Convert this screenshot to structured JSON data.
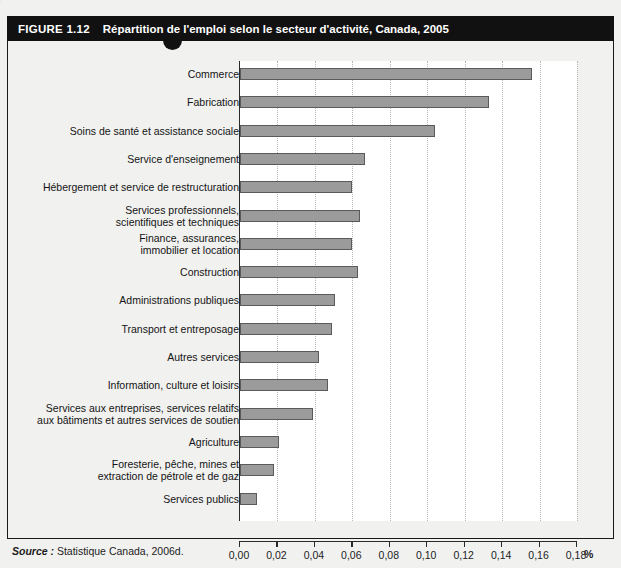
{
  "figure": {
    "number": "FIGURE 1.12",
    "title": "Répartition de l'emploi selon le secteur d'activité, Canada, 2005",
    "source_key": "Source :",
    "source_value": " Statistique Canada, 2006d."
  },
  "colors": {
    "header_bg": "#111111",
    "bar_fill": "#9b9b9b",
    "bar_stroke": "#5a5a5a",
    "axis": "#2a2a2a",
    "gridline": "#b8b8b8",
    "page_bg": "#f1f1f0"
  },
  "chart_data": {
    "type": "bar",
    "orientation": "horizontal",
    "title": "Répartition de l'emploi selon le secteur d'activité, Canada, 2005",
    "xlabel": "%",
    "ylabel": "",
    "xlim": [
      0,
      0.18
    ],
    "grid": true,
    "legend": "none",
    "xtick_labels": [
      "0,00",
      "0,02",
      "0,04",
      "0,06",
      "0,08",
      "0,10",
      "0,12",
      "0,14",
      "0,16",
      "0,18"
    ],
    "xtick_values": [
      0,
      0.02,
      0.04,
      0.06,
      0.08,
      0.1,
      0.12,
      0.14,
      0.16,
      0.18
    ],
    "categories": [
      "Commerce",
      "Fabrication",
      "Soins de santé et assistance sociale",
      "Service d'enseignement",
      "Hébergement et service de restructuration",
      "Services professionnels,\nscientifiques et techniques",
      "Finance, assurances,\nimmobilier et location",
      "Construction",
      "Administrations publiques",
      "Transport et entreposage",
      "Autres services",
      "Information, culture et loisirs",
      "Services aux entreprises, services relatifs\naux bâtiments et autres services de soutien",
      "Agriculture",
      "Foresterie, pêche, mines et\nextraction de pétrole et de gaz",
      "Services publics"
    ],
    "values": [
      0.156,
      0.133,
      0.104,
      0.067,
      0.06,
      0.064,
      0.06,
      0.063,
      0.051,
      0.049,
      0.042,
      0.047,
      0.039,
      0.021,
      0.018,
      0.009
    ]
  }
}
